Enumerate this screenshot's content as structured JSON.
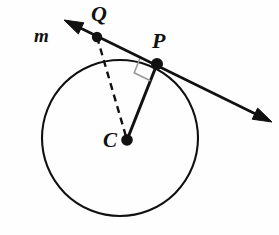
{
  "figure": {
    "type": "geometry-diagram",
    "background_color": "#fefefe",
    "stroke_color": "#111111",
    "right_angle_color": "#9a9a9a"
  },
  "labels": {
    "line_m": "m",
    "point_q": "Q",
    "point_p": "P",
    "point_c": "C"
  },
  "geometry": {
    "circle": {
      "name": "circle-C",
      "center_x": 120,
      "center_y": 138,
      "radius": 78,
      "stroke_width": 2.1
    },
    "points": [
      {
        "name": "point-q",
        "label": "Q",
        "x": 97,
        "y": 37,
        "dot_radius": 5.2
      },
      {
        "name": "point-p",
        "label": "P",
        "x": 157,
        "y": 64,
        "dot_radius": 6.0
      },
      {
        "name": "point-c",
        "label": "C",
        "x": 127,
        "y": 140,
        "dot_radius": 5.8
      }
    ],
    "line_m": {
      "name": "line-m",
      "label": "m",
      "arrow_start_x": 64,
      "arrow_start_y": 20,
      "arrow_end_x": 272,
      "arrow_end_y": 122,
      "stroke_width": 2.6,
      "double_headed": true
    },
    "segment_qc": {
      "name": "segment-qc",
      "x1": 97,
      "y1": 37,
      "x2": 127,
      "y2": 140,
      "style": "dashed",
      "dash_pattern": "7 5",
      "stroke_width": 2.4
    },
    "segment_pc": {
      "name": "segment-pc",
      "x1": 157,
      "y1": 64,
      "x2": 127,
      "y2": 140,
      "style": "solid",
      "stroke_width": 3.0
    },
    "right_angle_marker": {
      "name": "right-angle-marker",
      "vertex_x": 157,
      "vertex_y": 64,
      "size": 18,
      "stroke_width": 1.6,
      "at_point": "P"
    }
  }
}
